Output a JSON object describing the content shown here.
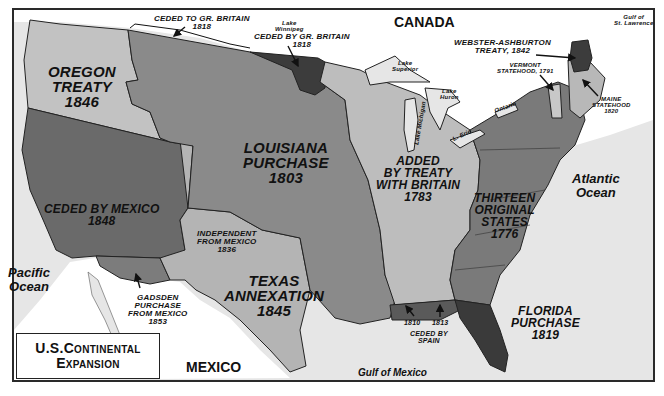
{
  "title": {
    "line1": "U.S.Continental",
    "line2": "Expansion"
  },
  "colors": {
    "water": "#e6e6e6",
    "foreign_land": "#ffffff",
    "thirteen_states": "#7a7a7a",
    "treaty_1783": "#bdbdbd",
    "louisiana": "#8a8a8a",
    "oregon": "#c2c2c2",
    "mexican_cession": "#6a6a6a",
    "texas": "#b4b4b4",
    "gadsden": "#7c7c7c",
    "dark_cessions": "#3c3c3c",
    "florida": "#3a3a3a",
    "maine": "#b8b8b8",
    "vermont": "#c8c8c8"
  },
  "countries": {
    "canada": "CANADA",
    "mexico": "MEXICO"
  },
  "oceans": {
    "pacific": "Pacific\nOcean",
    "atlantic": "Atlantic\nOcean",
    "gulf_of_mexico": "Gulf of Mexico",
    "gulf_st_lawrence": "Gulf of\nSt. Lawrence"
  },
  "lakes": {
    "winnipeg": "Lake\nWinnipeg",
    "superior": "Lake\nSuperior",
    "huron": "Lake\nHuron",
    "michigan": "Lake Michigan",
    "erie": "L. Erie",
    "ontario": "Ontario"
  },
  "regions": {
    "oregon": "OREGON\nTREATY\n1846",
    "louisiana": "LOUISIANA\nPURCHASE\n1803",
    "treaty_britain": "ADDED\nBY TREATY\nWITH BRITAIN\n1783",
    "thirteen": "THIRTEEN\nORIGINAL\nSTATES\n1776",
    "mexico_cession": "CEDED BY MEXICO\n1848",
    "texas": "TEXAS\nANNEXATION\n1845",
    "texas_independent": "INDEPENDENT\nFROM MEXICO\n1836",
    "gadsden": "GADSDEN\nPURCHASE\nFROM MEXICO\n1853",
    "florida": "FLORIDA\nPURCHASE\n1819",
    "ceded_to_britain": "CEDED TO GR. BRITAIN\n1818",
    "ceded_by_britain": "CEDED BY GR. BRITAIN\n1818",
    "webster": "WEBSTER-ASHBURTON\nTREATY, 1842",
    "vermont": "VERMONT\nSTATEHOOD, 1791",
    "maine": "MAINE\nSTATEHOOD\n1820",
    "spain_1810": "1810",
    "spain_1813": "1813",
    "spain_ceded": "CEDED BY\nSPAIN"
  }
}
